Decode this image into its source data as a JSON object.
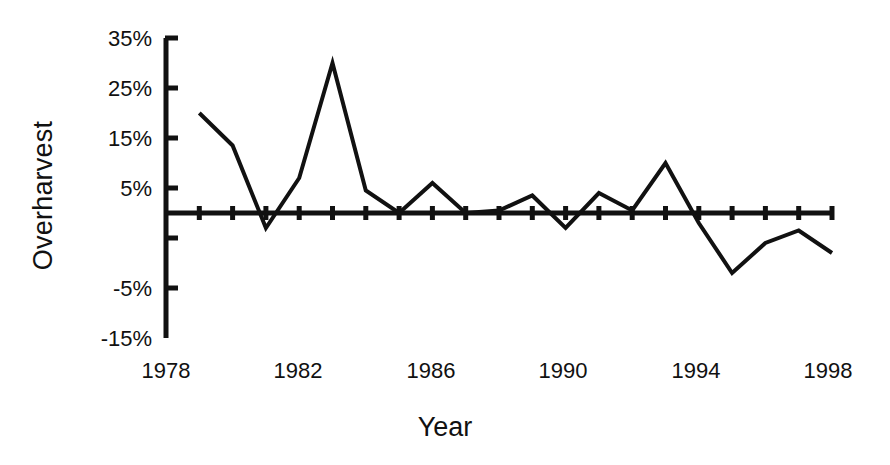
{
  "chart_data": {
    "type": "line",
    "title": "",
    "xlabel": "Year",
    "ylabel": "Overharvest",
    "xlim": [
      1978,
      1998
    ],
    "ylim": [
      -15,
      35
    ],
    "grid": false,
    "legend": null,
    "y_tick_labels": [
      "35%",
      "25%",
      "15%",
      "5%",
      "-5%",
      "-15%"
    ],
    "y_tick_values": [
      35,
      25,
      15,
      5,
      -5,
      -15
    ],
    "x_tick_labels": [
      "1978",
      "1982",
      "1986",
      "1990",
      "1994",
      "1998"
    ],
    "x_tick_values": [
      1978,
      1982,
      1986,
      1990,
      1994,
      1998
    ],
    "x_minor_tick_interval": 1,
    "x": [
      1979,
      1980,
      1981,
      1982,
      1983,
      1984,
      1985,
      1986,
      1987,
      1988,
      1989,
      1990,
      1991,
      1992,
      1993,
      1994,
      1995,
      1996,
      1997,
      1998
    ],
    "values": [
      20,
      13.5,
      -3,
      7,
      30,
      4.5,
      0,
      6,
      0,
      0.5,
      3.5,
      -3,
      4,
      0.5,
      10,
      -2,
      -12,
      -6,
      -3.5,
      -8
    ],
    "series": [
      {
        "name": "Overharvest",
        "values": [
          20,
          13.5,
          -3,
          7,
          30,
          4.5,
          0,
          6,
          0,
          0.5,
          3.5,
          -3,
          4,
          0.5,
          10,
          -2,
          -12,
          -6,
          -3.5,
          -8
        ]
      }
    ],
    "line_color": "#111111",
    "line_width": 4,
    "markers": false
  },
  "axis": {
    "y_title": "Overharvest",
    "x_title": "Year"
  }
}
